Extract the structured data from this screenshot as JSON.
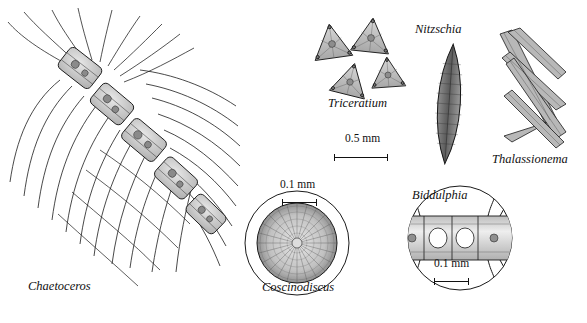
{
  "figure": {
    "width": 587,
    "height": 323,
    "background": "#ffffff",
    "ink": "#111111",
    "fill_light": "#cfcfcf",
    "fill_mid": "#9a9a9a"
  },
  "labels": [
    {
      "id": "chaetoceros",
      "text": "Chaetoceros",
      "x": 28,
      "y": 287,
      "style": "italic"
    },
    {
      "id": "triceratium",
      "text": "Triceratium",
      "x": 328,
      "y": 104,
      "style": "italic"
    },
    {
      "id": "nitzschia",
      "text": "Nitzschia",
      "x": 415,
      "y": 30,
      "style": "italic"
    },
    {
      "id": "thalassionema",
      "text": "Thalassionema",
      "x": 492,
      "y": 160,
      "style": "italic"
    },
    {
      "id": "coscinodiscus",
      "text": "Coscinodiscus",
      "x": 266,
      "y": 288,
      "style": "italic"
    },
    {
      "id": "biddulphia",
      "text": "Biddulphia",
      "x": 412,
      "y": 196,
      "style": "italic"
    }
  ],
  "scale_bars": [
    {
      "id": "scale-triceratium",
      "text": "0.5 mm",
      "text_x": 345,
      "text_y": 140,
      "bar_x": 334,
      "bar_y": 157,
      "bar_w": 54
    },
    {
      "id": "scale-coscinodiscus",
      "text": "0.1 mm",
      "text_x": 283,
      "text_y": 186,
      "bar_x": 282,
      "bar_y": 202,
      "bar_w": 35
    },
    {
      "id": "scale-biddulphia",
      "text": "0.1 mm",
      "text_x": 435,
      "text_y": 265,
      "bar_x": 434,
      "bar_y": 281,
      "bar_w": 35
    }
  ],
  "organisms": [
    {
      "id": "chaetoceros",
      "common_name": "Chaetoceros",
      "description": "chain of box-like cells with long radiating setae"
    },
    {
      "id": "triceratium",
      "common_name": "Triceratium",
      "description": "four triangular frustules with textured surfaces"
    },
    {
      "id": "nitzschia",
      "common_name": "Nitzschia",
      "description": "elongate spindle-shaped cell"
    },
    {
      "id": "thalassionema",
      "common_name": "Thalassionema",
      "description": "zig-zag chain of needle-like cells"
    },
    {
      "id": "coscinodiscus",
      "common_name": "Coscinodiscus",
      "description": "circular radially striated valve in round frame"
    },
    {
      "id": "biddulphia",
      "common_name": "Biddulphia",
      "description": "chain of rectangular cells with horns in round frame"
    }
  ]
}
